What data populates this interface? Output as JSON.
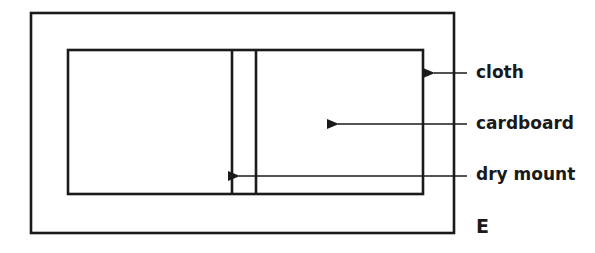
{
  "diagram": {
    "type": "labeled-schematic",
    "figure_letter": "E",
    "colors": {
      "line": "#1a1a1a",
      "background": "#ffffff"
    },
    "labels": [
      {
        "id": "cloth",
        "text": "cloth",
        "points_to": "outer rectangle edge"
      },
      {
        "id": "cardboard",
        "text": "cardboard",
        "points_to": "right board panel"
      },
      {
        "id": "dry_mount",
        "text": "dry mount",
        "points_to": "spine gap between boards"
      }
    ]
  }
}
